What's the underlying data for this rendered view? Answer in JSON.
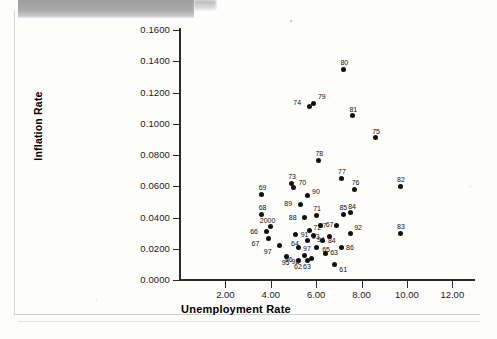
{
  "figure": {
    "type": "scatter-plot",
    "y_axis_title": "Inflation Rate",
    "x_axis_title": "Unemployment Rate"
  },
  "chart_data": {
    "type": "scatter",
    "title": "",
    "xlabel": "Unemployment Rate",
    "ylabel": "Inflation Rate",
    "xlim": [
      0.0,
      13.0
    ],
    "ylim": [
      0.0,
      0.16
    ],
    "grid": false,
    "legend": "none",
    "xticks": [
      "2.00",
      "4.00",
      "6.00",
      "8.00",
      "10.00",
      "12.00"
    ],
    "xtick_values": [
      2.0,
      4.0,
      6.0,
      8.0,
      10.0,
      12.0
    ],
    "yticks": [
      "0.0000",
      "0.0200",
      "0.0400",
      "0.0600",
      "0.0800",
      "0.1000",
      "0.1200",
      "0.1400",
      "0.1600"
    ],
    "ytick_values": [
      0.0,
      0.02,
      0.04,
      0.06,
      0.08,
      0.1,
      0.12,
      0.14,
      0.16
    ],
    "point_label_field": "year",
    "points": [
      {
        "label": "80",
        "x": 7.2,
        "y": 0.135,
        "lx": -3,
        "ly": -10
      },
      {
        "label": "74",
        "x": 5.7,
        "y": 0.111,
        "lx": -16,
        "ly": -8
      },
      {
        "label": "79",
        "x": 5.9,
        "y": 0.113,
        "lx": 4,
        "ly": -10
      },
      {
        "label": "81",
        "x": 7.6,
        "y": 0.105,
        "lx": -3,
        "ly": -10
      },
      {
        "label": "75",
        "x": 8.6,
        "y": 0.091,
        "lx": -3,
        "ly": -10
      },
      {
        "label": "78",
        "x": 6.1,
        "y": 0.0765,
        "lx": -3,
        "ly": -10
      },
      {
        "label": "77",
        "x": 7.1,
        "y": 0.065,
        "lx": -3,
        "ly": -10
      },
      {
        "label": "73",
        "x": 4.9,
        "y": 0.062,
        "lx": -3,
        "ly": -10
      },
      {
        "label": "82",
        "x": 9.7,
        "y": 0.06,
        "lx": -3,
        "ly": -10
      },
      {
        "label": "70",
        "x": 5.0,
        "y": 0.059,
        "lx": 5,
        "ly": -9
      },
      {
        "label": "76",
        "x": 7.7,
        "y": 0.058,
        "lx": -3,
        "ly": -10
      },
      {
        "label": "69",
        "x": 3.6,
        "y": 0.055,
        "lx": -3,
        "ly": -10
      },
      {
        "label": "90",
        "x": 5.6,
        "y": 0.054,
        "lx": 5,
        "ly": -8
      },
      {
        "label": "89",
        "x": 5.3,
        "y": 0.0485,
        "lx": -16,
        "ly": -4
      },
      {
        "label": "68",
        "x": 3.6,
        "y": 0.042,
        "lx": -3,
        "ly": -10
      },
      {
        "label": "85",
        "x": 7.2,
        "y": 0.042,
        "lx": -4,
        "ly": -10
      },
      {
        "label": "71",
        "x": 6.0,
        "y": 0.0415,
        "lx": -3,
        "ly": -10
      },
      {
        "label": "84",
        "x": 7.5,
        "y": 0.043,
        "lx": -2,
        "ly": -10
      },
      {
        "label": "88",
        "x": 5.5,
        "y": 0.04,
        "lx": -16,
        "ly": -4
      },
      {
        "label": "2000",
        "x": 4.0,
        "y": 0.034,
        "lx": -11,
        "ly": -10
      },
      {
        "label": "67",
        "x": 6.2,
        "y": 0.035,
        "lx": 5,
        "ly": -4
      },
      {
        "label": "87",
        "x": 6.9,
        "y": 0.035,
        "lx": -18,
        "ly": -3
      },
      {
        "label": "66",
        "x": 3.8,
        "y": 0.031,
        "lx": -16,
        "ly": -4
      },
      {
        "label": "72",
        "x": 5.7,
        "y": 0.0315,
        "lx": 4,
        "ly": -7
      },
      {
        "label": "92",
        "x": 7.5,
        "y": 0.03,
        "lx": 4,
        "ly": -9
      },
      {
        "label": "83",
        "x": 9.7,
        "y": 0.03,
        "lx": -3,
        "ly": -10
      },
      {
        "label": "94",
        "x": 5.9,
        "y": 0.0285,
        "lx": 3,
        "ly": 1
      },
      {
        "label": "91",
        "x": 5.1,
        "y": 0.029,
        "lx": 5,
        "ly": -4
      },
      {
        "label": "93",
        "x": 6.6,
        "y": 0.028,
        "lx": -18,
        "ly": -3
      },
      {
        "label": "67",
        "x": 3.9,
        "y": 0.0265,
        "lx": -17,
        "ly": 1
      },
      {
        "label": "84",
        "x": 6.3,
        "y": 0.0255,
        "lx": 5,
        "ly": -3
      },
      {
        "label": "64",
        "x": 5.6,
        "y": 0.0255,
        "lx": -16,
        "ly": 0
      },
      {
        "label": "86",
        "x": 7.1,
        "y": 0.021,
        "lx": 5,
        "ly": -3
      },
      {
        "label": "97",
        "x": 4.4,
        "y": 0.022,
        "lx": -16,
        "ly": 2
      },
      {
        "label": "97",
        "x": 5.2,
        "y": 0.021,
        "lx": 5,
        "ly": -2
      },
      {
        "label": "65",
        "x": 6.0,
        "y": 0.0205,
        "lx": 6,
        "ly": -2
      },
      {
        "label": "63",
        "x": 6.4,
        "y": 0.017,
        "lx": 5,
        "ly": -4
      },
      {
        "label": "95",
        "x": 4.7,
        "y": 0.015,
        "lx": -5,
        "ly": 2
      },
      {
        "label": "62",
        "x": 5.2,
        "y": 0.0125,
        "lx": -4,
        "ly": 3
      },
      {
        "label": "63",
        "x": 5.6,
        "y": 0.0125,
        "lx": -4,
        "ly": 3
      },
      {
        "label": "61",
        "x": 6.8,
        "y": 0.01,
        "lx": 5,
        "ly": 2
      },
      {
        "label": "96",
        "x": 5.5,
        "y": 0.0155,
        "lx": -20,
        "ly": 0
      },
      {
        "label": "98",
        "x": 5.8,
        "y": 0.014,
        "lx": -20,
        "ly": 0
      }
    ]
  }
}
